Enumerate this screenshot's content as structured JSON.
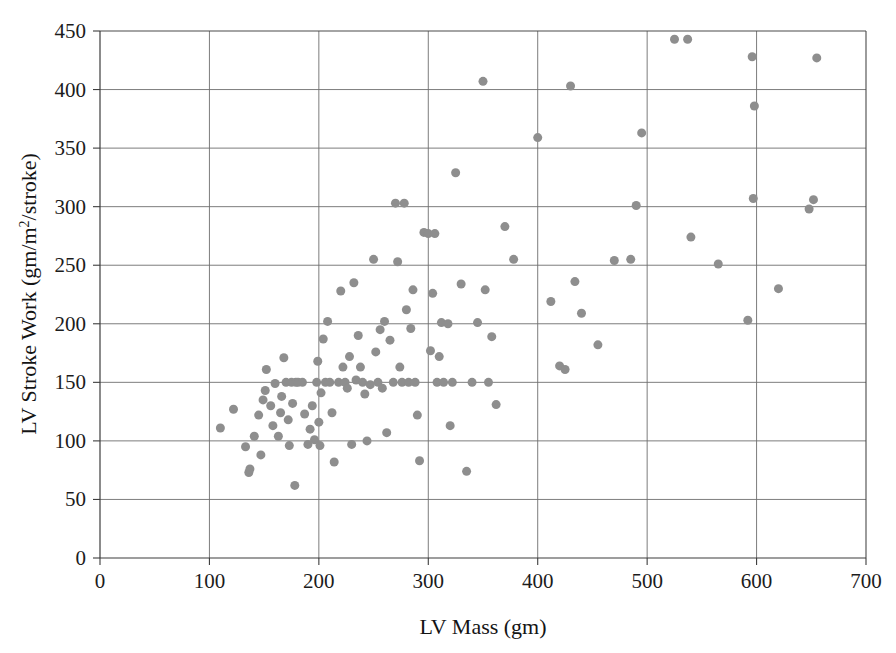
{
  "chart_data": {
    "type": "scatter",
    "title": "",
    "xlabel": "LV Mass (gm)",
    "ylabel_text": "LV Stroke Work (gm/m",
    "ylabel_sup": "2",
    "ylabel_tail": "/stroke)",
    "ylabel_full": "LV Stroke Work (gm/m2/stroke)",
    "xlim": [
      0,
      700
    ],
    "ylim": [
      0,
      450
    ],
    "xticks": [
      0,
      100,
      200,
      300,
      400,
      500,
      600,
      700
    ],
    "yticks": [
      0,
      50,
      100,
      150,
      200,
      250,
      300,
      350,
      400,
      450
    ],
    "grid": true,
    "legend": "none",
    "marker_color": "#8e8e8e",
    "marker_size_px": 9,
    "points": [
      [
        110,
        111
      ],
      [
        122,
        127
      ],
      [
        133,
        95
      ],
      [
        136,
        73
      ],
      [
        137,
        76
      ],
      [
        141,
        104
      ],
      [
        145,
        122
      ],
      [
        147,
        88
      ],
      [
        149,
        135
      ],
      [
        151,
        143
      ],
      [
        152,
        161
      ],
      [
        156,
        130
      ],
      [
        158,
        113
      ],
      [
        160,
        149
      ],
      [
        163,
        104
      ],
      [
        165,
        124
      ],
      [
        166,
        138
      ],
      [
        168,
        171
      ],
      [
        170,
        150
      ],
      [
        172,
        118
      ],
      [
        173,
        96
      ],
      [
        175,
        150
      ],
      [
        176,
        132
      ],
      [
        178,
        62
      ],
      [
        179,
        150
      ],
      [
        181,
        150
      ],
      [
        185,
        150
      ],
      [
        187,
        123
      ],
      [
        190,
        97
      ],
      [
        192,
        110
      ],
      [
        194,
        130
      ],
      [
        196,
        101
      ],
      [
        198,
        150
      ],
      [
        199,
        168
      ],
      [
        200,
        116
      ],
      [
        201,
        96
      ],
      [
        202,
        141
      ],
      [
        204,
        187
      ],
      [
        206,
        150
      ],
      [
        208,
        202
      ],
      [
        210,
        150
      ],
      [
        212,
        124
      ],
      [
        214,
        82
      ],
      [
        218,
        150
      ],
      [
        220,
        228
      ],
      [
        222,
        163
      ],
      [
        224,
        150
      ],
      [
        226,
        145
      ],
      [
        228,
        172
      ],
      [
        230,
        97
      ],
      [
        232,
        235
      ],
      [
        234,
        152
      ],
      [
        236,
        190
      ],
      [
        238,
        163
      ],
      [
        240,
        150
      ],
      [
        242,
        140
      ],
      [
        244,
        100
      ],
      [
        247,
        148
      ],
      [
        250,
        255
      ],
      [
        252,
        176
      ],
      [
        254,
        150
      ],
      [
        256,
        195
      ],
      [
        258,
        145
      ],
      [
        260,
        202
      ],
      [
        262,
        107
      ],
      [
        265,
        186
      ],
      [
        268,
        150
      ],
      [
        270,
        303
      ],
      [
        272,
        253
      ],
      [
        274,
        163
      ],
      [
        276,
        150
      ],
      [
        278,
        303
      ],
      [
        280,
        212
      ],
      [
        282,
        150
      ],
      [
        284,
        196
      ],
      [
        286,
        229
      ],
      [
        288,
        150
      ],
      [
        290,
        122
      ],
      [
        292,
        83
      ],
      [
        296,
        278
      ],
      [
        300,
        277
      ],
      [
        302,
        177
      ],
      [
        304,
        226
      ],
      [
        306,
        277
      ],
      [
        308,
        150
      ],
      [
        310,
        172
      ],
      [
        312,
        201
      ],
      [
        314,
        150
      ],
      [
        318,
        200
      ],
      [
        320,
        113
      ],
      [
        322,
        150
      ],
      [
        325,
        329
      ],
      [
        330,
        234
      ],
      [
        335,
        74
      ],
      [
        340,
        150
      ],
      [
        345,
        201
      ],
      [
        350,
        407
      ],
      [
        352,
        229
      ],
      [
        355,
        150
      ],
      [
        358,
        189
      ],
      [
        362,
        131
      ],
      [
        370,
        283
      ],
      [
        378,
        255
      ],
      [
        400,
        359
      ],
      [
        412,
        219
      ],
      [
        420,
        164
      ],
      [
        425,
        161
      ],
      [
        430,
        403
      ],
      [
        434,
        236
      ],
      [
        440,
        209
      ],
      [
        455,
        182
      ],
      [
        470,
        254
      ],
      [
        485,
        255
      ],
      [
        490,
        301
      ],
      [
        495,
        363
      ],
      [
        525,
        443
      ],
      [
        537,
        443
      ],
      [
        540,
        274
      ],
      [
        565,
        251
      ],
      [
        592,
        203
      ],
      [
        596,
        428
      ],
      [
        597,
        307
      ],
      [
        598,
        386
      ],
      [
        620,
        230
      ],
      [
        648,
        298
      ],
      [
        652,
        306
      ],
      [
        655,
        427
      ]
    ]
  }
}
